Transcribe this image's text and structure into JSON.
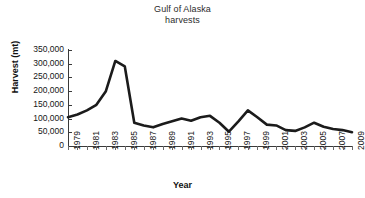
{
  "chart_data": {
    "type": "line",
    "title": "Gulf of Alaska harvests",
    "title_lines": [
      "Gulf of Alaska",
      "harvests"
    ],
    "xlabel": "Year",
    "ylabel": "Harvest (mt)",
    "xlim": [
      1979,
      2009
    ],
    "ylim": [
      0,
      350000
    ],
    "ytick_labels": [
      "350,000",
      "300,000",
      "250,000",
      "200,000",
      "150,000",
      "100,000",
      "50,000",
      "0"
    ],
    "ytick_values": [
      350000,
      300000,
      250000,
      200000,
      150000,
      100000,
      50000,
      0
    ],
    "xtick_labels": [
      "1979",
      "1981",
      "1983",
      "1985",
      "1987",
      "1989",
      "1991",
      "1993",
      "1995",
      "1997",
      "1999",
      "2001",
      "2003",
      "2005",
      "2007",
      "2009"
    ],
    "xtick_values": [
      1979,
      1981,
      1983,
      1985,
      1987,
      1989,
      1991,
      1993,
      1995,
      1997,
      1999,
      2001,
      2003,
      2005,
      2007,
      2009
    ],
    "grid": false,
    "legend": "none",
    "line_color": "#1b1b1b",
    "x": [
      1979,
      1980,
      1981,
      1982,
      1983,
      1984,
      1985,
      1986,
      1987,
      1988,
      1989,
      1990,
      1991,
      1992,
      1993,
      1994,
      1995,
      1996,
      1997,
      1998,
      1999,
      2000,
      2001,
      2002,
      2003,
      2004,
      2005,
      2006,
      2007,
      2008,
      2009
    ],
    "values": [
      105000,
      115000,
      130000,
      150000,
      200000,
      310000,
      290000,
      85000,
      75000,
      68000,
      80000,
      90000,
      100000,
      92000,
      105000,
      110000,
      85000,
      52000,
      90000,
      130000,
      105000,
      78000,
      75000,
      58000,
      55000,
      68000,
      85000,
      70000,
      62000,
      58000,
      50000
    ],
    "series": [
      {
        "name": "Gulf of Alaska harvests",
        "values": [
          105000,
          115000,
          130000,
          150000,
          200000,
          310000,
          290000,
          85000,
          75000,
          68000,
          80000,
          90000,
          100000,
          92000,
          105000,
          110000,
          85000,
          52000,
          90000,
          130000,
          105000,
          78000,
          75000,
          58000,
          55000,
          68000,
          85000,
          70000,
          62000,
          58000,
          50000
        ]
      }
    ]
  }
}
